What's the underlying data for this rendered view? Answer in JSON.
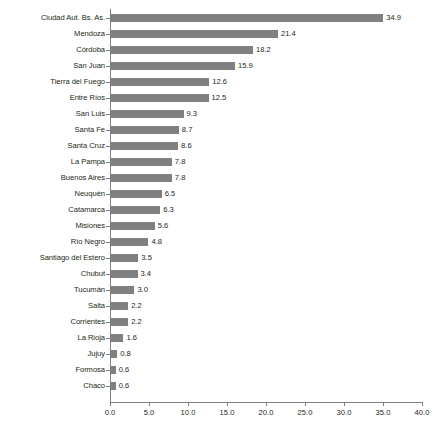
{
  "chart_data": {
    "type": "bar",
    "orientation": "horizontal",
    "title": "",
    "subtitle": "",
    "xlabel": "",
    "ylabel": "",
    "xlim": [
      0.0,
      40.0
    ],
    "xticks": [
      "0.0",
      "5.0",
      "10.0",
      "15.0",
      "20.0",
      "25.0",
      "30.0",
      "35.0",
      "40.0"
    ],
    "xtick_values": [
      0.0,
      5.0,
      10.0,
      15.0,
      20.0,
      25.0,
      30.0,
      35.0,
      40.0
    ],
    "grid": false,
    "legend": "none",
    "bar_color": "#808080",
    "axis_color": "#7f7f7f",
    "text_color": "#231f20",
    "categories": [
      "Ciudad Aut. Bs. As.",
      "Mendoza",
      "Córdoba",
      "San Juan",
      "Tierra del Fuego",
      "Entre Ríos",
      "San Luis",
      "Santa Fe",
      "Santa Cruz",
      "La Pampa",
      "Buenos Aires",
      "Neuquén",
      "Catamarca",
      "Misiones",
      "Río Negro",
      "Santiago del Estero",
      "Chubut",
      "Tucumán",
      "Salta",
      "Corrientes",
      "La Rioja",
      "Jujuy",
      "Formosa",
      "Chaco"
    ],
    "values": [
      34.9,
      21.4,
      18.2,
      15.9,
      12.6,
      12.5,
      9.3,
      8.7,
      8.6,
      7.8,
      7.8,
      6.5,
      6.3,
      5.6,
      4.8,
      3.5,
      3.4,
      3.0,
      2.2,
      2.2,
      1.6,
      0.8,
      0.6,
      0.6
    ],
    "value_labels": [
      "34.9",
      "21.4",
      "18.2",
      "15.9",
      "12.6",
      "12.5",
      "9.3",
      "8.7",
      "8.6",
      "7.8",
      "7.8",
      "6.5",
      "6.3",
      "5.6",
      "4.8",
      "3.5",
      "3.4",
      "3.0",
      "2.2",
      "2.2",
      "1.6",
      "0.8",
      "0.6",
      "0.6"
    ]
  }
}
